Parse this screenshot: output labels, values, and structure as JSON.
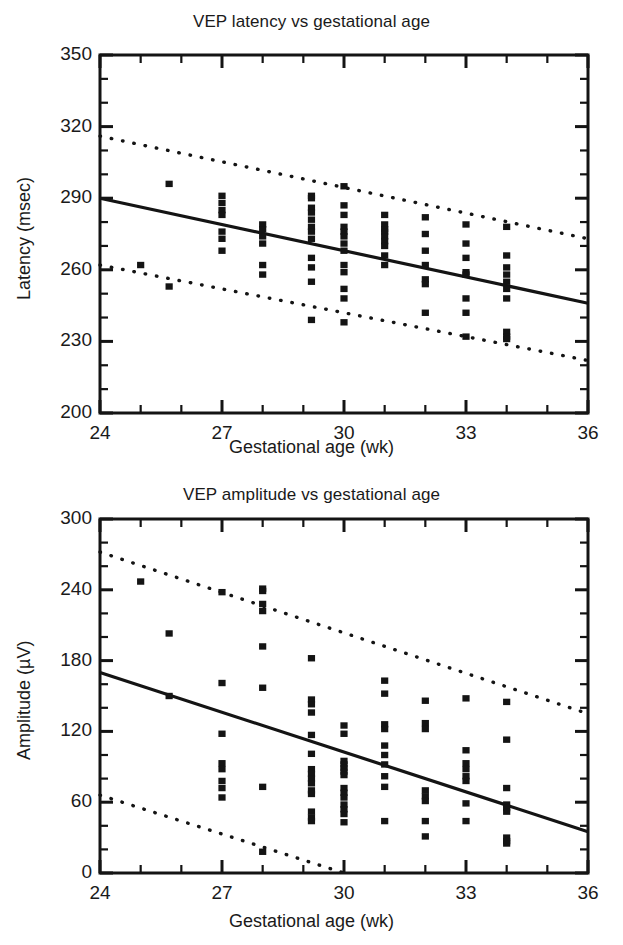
{
  "figure": {
    "background_color": "#ffffff",
    "ink_color": "#141414"
  },
  "charts": [
    {
      "id": "latency",
      "title": "VEP latency vs gestational age",
      "xlabel": "Gestational age (wk)",
      "ylabel": "Latency (msec)",
      "xticks": [
        "24",
        "27",
        "30",
        "33",
        "36"
      ],
      "yticks": [
        "200",
        "230",
        "260",
        "290",
        "320",
        "350"
      ]
    },
    {
      "id": "amplitude",
      "title": "VEP amplitude vs gestational age",
      "xlabel": "Gestational age (wk)",
      "ylabel": "Amplitude (µV)",
      "xticks": [
        "24",
        "27",
        "30",
        "33",
        "36"
      ],
      "yticks": [
        "0",
        "60",
        "120",
        "180",
        "240",
        "300"
      ]
    }
  ],
  "chart_data": [
    {
      "type": "scatter",
      "id": "latency",
      "title": "VEP latency vs gestational age",
      "xlabel": "Gestational age (wk)",
      "ylabel": "Latency (msec)",
      "xlim": [
        24,
        36
      ],
      "ylim": [
        200,
        350
      ],
      "xticks": [
        24,
        27,
        30,
        33,
        36
      ],
      "yticks": [
        200,
        230,
        260,
        290,
        320,
        350
      ],
      "xminor_step": 1,
      "yminor_step": 10,
      "grid": false,
      "legend": "none",
      "marker": "filled-square",
      "series": [
        {
          "name": "VEP latency",
          "points": [
            [
              25,
              262
            ],
            [
              25.7,
              296
            ],
            [
              25.7,
              253
            ],
            [
              27,
              291
            ],
            [
              27,
              288
            ],
            [
              27,
              285
            ],
            [
              27,
              283
            ],
            [
              27,
              276
            ],
            [
              27,
              273
            ],
            [
              27,
              268
            ],
            [
              28,
              279
            ],
            [
              28,
              277
            ],
            [
              28,
              274
            ],
            [
              28,
              271
            ],
            [
              28,
              262
            ],
            [
              28,
              258
            ],
            [
              29.2,
              291
            ],
            [
              29.2,
              290
            ],
            [
              29.2,
              286
            ],
            [
              29.2,
              284
            ],
            [
              29.2,
              281
            ],
            [
              29.2,
              278
            ],
            [
              29.2,
              276
            ],
            [
              29.2,
              273
            ],
            [
              29.2,
              265
            ],
            [
              29.2,
              261
            ],
            [
              29.2,
              255
            ],
            [
              29.2,
              239
            ],
            [
              30,
              295
            ],
            [
              30,
              287
            ],
            [
              30,
              283
            ],
            [
              30,
              278
            ],
            [
              30,
              276
            ],
            [
              30,
              274
            ],
            [
              30,
              271
            ],
            [
              30,
              268
            ],
            [
              30,
              262
            ],
            [
              30,
              259
            ],
            [
              30,
              252
            ],
            [
              30,
              248
            ],
            [
              30,
              238
            ],
            [
              31,
              283
            ],
            [
              31,
              279
            ],
            [
              31,
              277
            ],
            [
              31,
              276
            ],
            [
              31,
              274
            ],
            [
              31,
              272
            ],
            [
              31,
              270
            ],
            [
              31,
              266
            ],
            [
              31,
              262
            ],
            [
              32,
              282
            ],
            [
              32,
              275
            ],
            [
              32,
              268
            ],
            [
              32,
              262
            ],
            [
              32,
              256
            ],
            [
              32,
              254
            ],
            [
              32,
              242
            ],
            [
              33,
              279
            ],
            [
              33,
              271
            ],
            [
              33,
              265
            ],
            [
              33,
              259
            ],
            [
              33,
              258
            ],
            [
              33,
              248
            ],
            [
              33,
              242
            ],
            [
              33,
              232
            ],
            [
              34,
              278
            ],
            [
              34,
              266
            ],
            [
              34,
              261
            ],
            [
              34,
              258
            ],
            [
              34,
              255
            ],
            [
              34,
              252
            ],
            [
              34,
              248
            ],
            [
              34,
              234
            ],
            [
              34,
              232
            ],
            [
              34,
              231
            ]
          ]
        }
      ],
      "fit_line": {
        "name": "regression line",
        "style": "solid",
        "x": [
          24,
          36
        ],
        "y": [
          290,
          246
        ]
      },
      "confidence_bands": [
        {
          "name": "upper 95% limit",
          "style": "dotted",
          "x": [
            24,
            36
          ],
          "y": [
            316,
            273
          ]
        },
        {
          "name": "lower 95% limit",
          "style": "dotted",
          "x": [
            24,
            36
          ],
          "y": [
            262,
            222
          ]
        }
      ]
    },
    {
      "type": "scatter",
      "id": "amplitude",
      "title": "VEP amplitude vs gestational age",
      "xlabel": "Gestational age (wk)",
      "ylabel": "Amplitude (µV)",
      "xlim": [
        24,
        36
      ],
      "ylim": [
        0,
        300
      ],
      "xticks": [
        24,
        27,
        30,
        33,
        36
      ],
      "yticks": [
        0,
        60,
        120,
        180,
        240,
        300
      ],
      "xminor_step": 1,
      "yminor_step": 20,
      "grid": false,
      "legend": "none",
      "marker": "filled-square",
      "series": [
        {
          "name": "VEP amplitude",
          "points": [
            [
              25,
              247
            ],
            [
              25.7,
              203
            ],
            [
              25.7,
              150
            ],
            [
              27,
              238
            ],
            [
              27,
              161
            ],
            [
              27,
              118
            ],
            [
              27,
              93
            ],
            [
              27,
              88
            ],
            [
              27,
              78
            ],
            [
              27,
              72
            ],
            [
              27,
              64
            ],
            [
              28,
              241
            ],
            [
              28,
              239
            ],
            [
              28,
              228
            ],
            [
              28,
              222
            ],
            [
              28,
              192
            ],
            [
              28,
              157
            ],
            [
              28,
              73
            ],
            [
              28,
              18
            ],
            [
              29.2,
              182
            ],
            [
              29.2,
              147
            ],
            [
              29.2,
              143
            ],
            [
              29.2,
              136
            ],
            [
              29.2,
              117
            ],
            [
              29.2,
              101
            ],
            [
              29.2,
              88
            ],
            [
              29.2,
              84
            ],
            [
              29.2,
              80
            ],
            [
              29.2,
              76
            ],
            [
              29.2,
              70
            ],
            [
              29.2,
              67
            ],
            [
              29.2,
              52
            ],
            [
              29.2,
              47
            ],
            [
              29.2,
              44
            ],
            [
              30,
              125
            ],
            [
              30,
              118
            ],
            [
              30,
              95
            ],
            [
              30,
              92
            ],
            [
              30,
              89
            ],
            [
              30,
              86
            ],
            [
              30,
              83
            ],
            [
              30,
              72
            ],
            [
              30,
              68
            ],
            [
              30,
              64
            ],
            [
              30,
              58
            ],
            [
              30,
              54
            ],
            [
              30,
              50
            ],
            [
              30,
              43
            ],
            [
              31,
              163
            ],
            [
              31,
              152
            ],
            [
              31,
              126
            ],
            [
              31,
              122
            ],
            [
              31,
              108
            ],
            [
              31,
              100
            ],
            [
              31,
              92
            ],
            [
              31,
              82
            ],
            [
              31,
              73
            ],
            [
              31,
              44
            ],
            [
              32,
              146
            ],
            [
              32,
              127
            ],
            [
              32,
              122
            ],
            [
              32,
              70
            ],
            [
              32,
              65
            ],
            [
              32,
              61
            ],
            [
              32,
              44
            ],
            [
              32,
              31
            ],
            [
              33,
              148
            ],
            [
              33,
              104
            ],
            [
              33,
              93
            ],
            [
              33,
              88
            ],
            [
              33,
              82
            ],
            [
              33,
              78
            ],
            [
              33,
              59
            ],
            [
              33,
              44
            ],
            [
              34,
              145
            ],
            [
              34,
              113
            ],
            [
              34,
              72
            ],
            [
              34,
              58
            ],
            [
              34,
              55
            ],
            [
              34,
              52
            ],
            [
              34,
              30
            ],
            [
              34,
              27
            ],
            [
              34,
              25
            ]
          ]
        }
      ],
      "fit_line": {
        "name": "regression line",
        "style": "solid",
        "x": [
          24,
          36
        ],
        "y": [
          170,
          35
        ]
      },
      "confidence_bands": [
        {
          "name": "upper 95% limit",
          "style": "dotted",
          "x": [
            24,
            36
          ],
          "y": [
            272,
            135
          ]
        },
        {
          "name": "lower 95% limit",
          "style": "dotted",
          "x": [
            24,
            30
          ],
          "y": [
            66,
            0
          ]
        }
      ]
    }
  ]
}
